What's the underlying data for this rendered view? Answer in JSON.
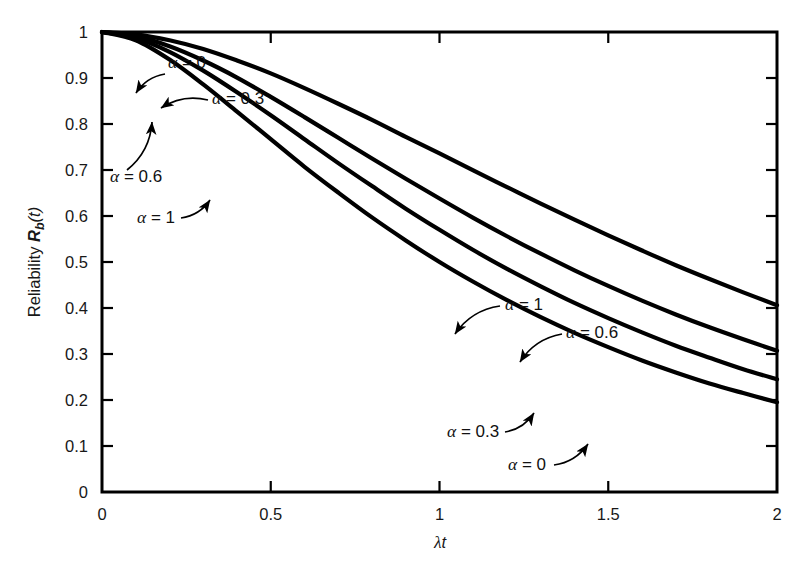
{
  "chart_data": {
    "type": "line",
    "title": "",
    "xlabel": "λt",
    "ylabel": "Reliability R_b(t)",
    "xlim": [
      0,
      2
    ],
    "ylim": [
      0,
      1
    ],
    "grid": false,
    "legend_position": "inline-annotations",
    "x_ticks": [
      "0",
      "0.5",
      "1",
      "1.5",
      "2"
    ],
    "x_tick_values": [
      0,
      0.5,
      1,
      1.5,
      2
    ],
    "y_ticks": [
      "0",
      "0.1",
      "0.2",
      "0.3",
      "0.4",
      "0.5",
      "0.6",
      "0.7",
      "0.8",
      "0.9",
      "1"
    ],
    "y_tick_values": [
      0,
      0.1,
      0.2,
      0.3,
      0.4,
      0.5,
      0.6,
      0.7,
      0.8,
      0.9,
      1
    ],
    "x": [
      0,
      0.1,
      0.2,
      0.3,
      0.4,
      0.5,
      0.6,
      0.7,
      0.8,
      0.9,
      1.0,
      1.1,
      1.2,
      1.3,
      1.4,
      1.5,
      1.6,
      1.7,
      1.8,
      1.9,
      2.0
    ],
    "series": [
      {
        "name": "α = 0",
        "alpha": 0,
        "values": [
          1.0,
          0.995,
          0.982,
          0.963,
          0.938,
          0.91,
          0.878,
          0.844,
          0.809,
          0.772,
          0.736,
          0.699,
          0.663,
          0.627,
          0.592,
          0.558,
          0.525,
          0.493,
          0.463,
          0.434,
          0.406
        ]
      },
      {
        "name": "α = 0.3",
        "alpha": 0.3,
        "values": [
          1.0,
          0.991,
          0.969,
          0.938,
          0.901,
          0.859,
          0.815,
          0.77,
          0.725,
          0.681,
          0.638,
          0.596,
          0.556,
          0.518,
          0.482,
          0.448,
          0.416,
          0.386,
          0.358,
          0.332,
          0.307
        ]
      },
      {
        "name": "α = 0.6",
        "alpha": 0.6,
        "values": [
          1.0,
          0.987,
          0.957,
          0.916,
          0.869,
          0.819,
          0.767,
          0.715,
          0.665,
          0.616,
          0.57,
          0.526,
          0.485,
          0.447,
          0.411,
          0.378,
          0.347,
          0.318,
          0.292,
          0.267,
          0.245
        ]
      },
      {
        "name": "α = 1",
        "alpha": 1,
        "values": [
          1.0,
          0.982,
          0.94,
          0.886,
          0.827,
          0.767,
          0.707,
          0.651,
          0.597,
          0.547,
          0.5,
          0.457,
          0.417,
          0.38,
          0.346,
          0.315,
          0.286,
          0.26,
          0.236,
          0.215,
          0.195
        ]
      }
    ],
    "annotations": [
      {
        "id": "left-alpha-0",
        "text": "α = 0",
        "x": 168,
        "y": 68,
        "arrow_from": [
          165,
          74
        ],
        "arrow_to": [
          136,
          93
        ]
      },
      {
        "id": "left-alpha-03",
        "text": "α = 0.3",
        "x": 212,
        "y": 104,
        "arrow_from": [
          208,
          100
        ],
        "arrow_to": [
          161,
          108
        ]
      },
      {
        "id": "left-alpha-06",
        "text": "α = 0.6",
        "x": 110,
        "y": 182,
        "arrow_from": [
          127,
          170
        ],
        "arrow_to": [
          152,
          122
        ]
      },
      {
        "id": "left-alpha-1",
        "text": "α = 1",
        "x": 137,
        "y": 223,
        "arrow_from": [
          181,
          218
        ],
        "arrow_to": [
          210,
          200
        ]
      },
      {
        "id": "right-alpha-1",
        "text": "α = 1",
        "x": 505,
        "y": 310,
        "arrow_from": [
          500,
          306
        ],
        "arrow_to": [
          455,
          334
        ]
      },
      {
        "id": "right-alpha-06",
        "text": "α = 0.6",
        "x": 566,
        "y": 338,
        "arrow_from": [
          562,
          334
        ],
        "arrow_to": [
          520,
          362
        ]
      },
      {
        "id": "right-alpha-03",
        "text": "α = 0.3",
        "x": 447,
        "y": 437,
        "arrow_from": [
          505,
          432
        ],
        "arrow_to": [
          534,
          413
        ]
      },
      {
        "id": "right-alpha-0",
        "text": "α = 0",
        "x": 508,
        "y": 470,
        "arrow_from": [
          554,
          465
        ],
        "arrow_to": [
          588,
          444
        ]
      }
    ]
  },
  "axes": {
    "y_label_parts": {
      "word": "Reliability",
      "symbol": "R",
      "subscript": "b",
      "arg": "(t)"
    },
    "x_label_parts": {
      "lambda": "λ",
      "t": "t"
    }
  },
  "colors": {
    "curve": "#000000",
    "axis": "#000000",
    "text": "#181818",
    "background": "#ffffff"
  }
}
